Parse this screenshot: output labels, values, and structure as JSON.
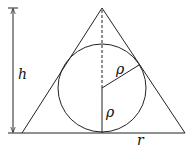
{
  "diagram": {
    "labels": {
      "height": "h",
      "radius_incircle_slant": "ρ",
      "radius_incircle_vertical": "ρ",
      "base_half_width": "r"
    },
    "colors": {
      "stroke": "#222222",
      "background": "#ffffff"
    }
  }
}
